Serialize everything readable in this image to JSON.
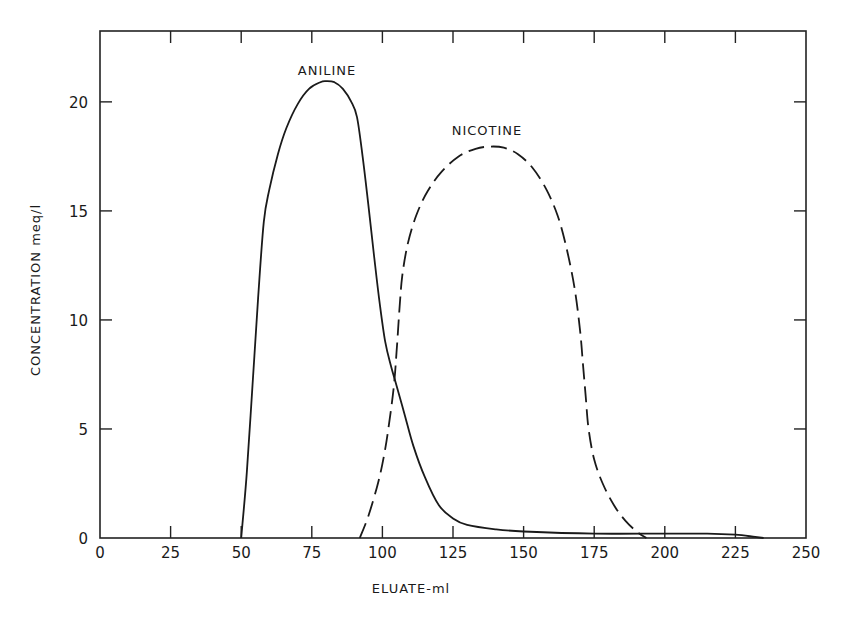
{
  "chart_data": {
    "type": "line",
    "title": "",
    "xlabel": "ELUATE-ml",
    "ylabel": "CONCENTRATION  meq/l",
    "xlim": [
      0,
      250
    ],
    "ylim": [
      0,
      23.25
    ],
    "grid": false,
    "legend": "none (series labeled inline above curves)",
    "x_ticks": [
      0,
      25,
      50,
      75,
      100,
      125,
      150,
      175,
      200,
      225,
      250
    ],
    "x_tick_labels": [
      "0",
      "25",
      "50",
      "75",
      "100",
      "125",
      "150",
      "175",
      "200",
      "225",
      "250"
    ],
    "y_ticks": [
      0,
      5,
      10,
      15,
      20
    ],
    "y_tick_labels": [
      "0",
      "5",
      "10",
      "15",
      "20"
    ],
    "series": [
      {
        "name": "ANILINE",
        "style": "solid",
        "x": [
          50,
          52,
          54,
          56,
          58,
          60,
          63,
          66,
          70,
          74,
          78,
          80,
          83,
          86,
          89,
          91,
          93,
          95,
          97,
          99,
          101,
          103,
          105,
          108,
          111,
          115,
          120,
          125,
          130,
          140,
          150,
          175,
          200,
          215,
          225,
          232,
          235
        ],
        "y": [
          0,
          3.0,
          7.0,
          11.0,
          14.5,
          16.0,
          17.6,
          18.8,
          19.9,
          20.6,
          20.9,
          20.95,
          20.9,
          20.6,
          20.0,
          19.3,
          17.5,
          15.3,
          13.0,
          10.8,
          9.0,
          7.9,
          7.0,
          5.6,
          4.2,
          2.8,
          1.5,
          0.9,
          0.6,
          0.4,
          0.3,
          0.2,
          0.2,
          0.2,
          0.15,
          0.05,
          0
        ]
      },
      {
        "name": "NICOTINE",
        "style": "dashed",
        "x": [
          92,
          95,
          98,
          100,
          102,
          104,
          105,
          106,
          107,
          109,
          112,
          116,
          121,
          127,
          133,
          138,
          143,
          148,
          153,
          158,
          162,
          165,
          168,
          170,
          171,
          172,
          173,
          175,
          178,
          182,
          186,
          190,
          193.5
        ],
        "y": [
          0,
          1.0,
          2.3,
          3.4,
          4.9,
          6.9,
          8.5,
          10.4,
          12.0,
          13.5,
          14.8,
          15.9,
          16.8,
          17.5,
          17.85,
          17.95,
          17.9,
          17.6,
          17.0,
          16.0,
          14.8,
          13.4,
          11.5,
          9.5,
          8.0,
          6.5,
          5.0,
          3.6,
          2.5,
          1.5,
          0.8,
          0.3,
          0
        ]
      }
    ],
    "annotations": [
      {
        "text": "ANILINE",
        "x": 80,
        "y": 22.1
      },
      {
        "text": "NICOTINE",
        "x": 137,
        "y": 18.9
      }
    ]
  },
  "labels": {
    "aniline": "ANILINE",
    "nicotine": "NICOTINE",
    "xlabel": "ELUATE-ml",
    "ylabel": "CONCENTRATION  meq/l"
  }
}
